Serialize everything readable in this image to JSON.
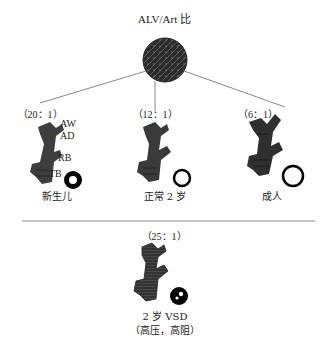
{
  "title": "ALV/Art 比",
  "top_group": [
    {
      "ratio": "（20：1）",
      "caption": "新生儿",
      "vessel": "thick-wall"
    },
    {
      "ratio": "（12：1）",
      "caption": "正常 2 岁",
      "vessel": "thin-wall"
    },
    {
      "ratio": "（6：1）",
      "caption": "成人",
      "vessel": "thin-wall-large"
    }
  ],
  "airway_labels": [
    "AW",
    "AD",
    "RB",
    "TB"
  ],
  "bottom": {
    "ratio": "（25：1）",
    "caption": "2 岁 VSD",
    "subcaption": "（高压，高阻）",
    "vessel": "occluded"
  },
  "colors": {
    "tree": "#3a3a3a",
    "alveolus": "#2a2a2a",
    "line": "#888888"
  }
}
